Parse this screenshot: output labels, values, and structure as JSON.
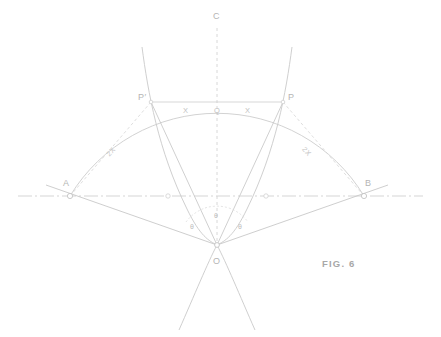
{
  "figure": {
    "caption": "FIG. 6",
    "colors": {
      "line": "#cccccc",
      "line_dark": "#c2c2c2",
      "dashed": "#d2d2d2",
      "text": "#b5b5b5",
      "background": "#ffffff"
    },
    "points": [
      {
        "id": "C",
        "label": "C",
        "x": 217,
        "y": 18,
        "desc": "top-of-vertical-axis"
      },
      {
        "id": "Pp",
        "label": "P′",
        "x": 151,
        "y": 102,
        "desc": "left-chord-endpoint"
      },
      {
        "id": "P",
        "label": "P",
        "x": 283,
        "y": 102,
        "desc": "right-chord-endpoint"
      },
      {
        "id": "Q",
        "label": "Q",
        "x": 217,
        "y": 102,
        "desc": "chord-midpoint-on-axis"
      },
      {
        "id": "A",
        "label": "A",
        "x": 70,
        "y": 196,
        "desc": "left-base-point"
      },
      {
        "id": "B",
        "label": "B",
        "x": 364,
        "y": 196,
        "desc": "right-base-point"
      },
      {
        "id": "O",
        "label": "O",
        "x": 217,
        "y": 245,
        "desc": "apex-vertex-center"
      }
    ],
    "dimension_labels": [
      {
        "id": "x-left",
        "label": "X",
        "desc": "half-chord-left"
      },
      {
        "id": "x-right",
        "label": "X",
        "desc": "half-chord-right"
      },
      {
        "id": "2x-left",
        "label": "2X",
        "desc": "chord-A-to-Pprime"
      },
      {
        "id": "2x-right",
        "label": "2X",
        "desc": "chord-B-to-P"
      }
    ],
    "angle_labels": [
      {
        "id": "theta-left",
        "label": "θ",
        "desc": "angle-left-of-axis"
      },
      {
        "id": "theta-center",
        "label": "θ",
        "desc": "angle-at-axis"
      },
      {
        "id": "theta-right",
        "label": "θ",
        "desc": "angle-right-of-axis"
      }
    ]
  }
}
